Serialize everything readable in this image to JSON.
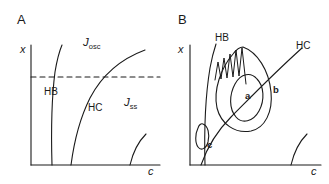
{
  "figure": {
    "background": "#ffffff",
    "stroke": "#1a1a1a",
    "width": 329,
    "height": 184
  },
  "panels": [
    {
      "id": "A",
      "letter": "A",
      "axes": {
        "y_label": "x",
        "x_label": "c"
      },
      "curves": [
        {
          "name": "HB",
          "label": "HB",
          "kind": "hopf-bifurcation-curve"
        },
        {
          "name": "HC",
          "label": "HC",
          "kind": "homoclinic-curve"
        },
        {
          "name": "saddle-node",
          "label": "",
          "kind": "lower-right-curve"
        },
        {
          "name": "dashed-section",
          "label": "",
          "kind": "dashed-horizontal-line"
        }
      ],
      "regions": [
        {
          "id": "J_osc",
          "base": "J",
          "sub": "osc"
        },
        {
          "id": "J_ss",
          "base": "J",
          "sub": "ss"
        }
      ]
    },
    {
      "id": "B",
      "letter": "B",
      "axes": {
        "y_label": "x",
        "x_label": "c"
      },
      "curves": [
        {
          "name": "HB",
          "label": "HB",
          "kind": "hopf-bifurcation-curve"
        },
        {
          "name": "HC",
          "label": "HC",
          "kind": "homoclinic-curve"
        },
        {
          "name": "saddle-node",
          "label": "",
          "kind": "lower-right-curve"
        },
        {
          "name": "oscillation",
          "label": "",
          "kind": "spiky-oscillation-trace"
        }
      ],
      "loops": [
        {
          "id": "a",
          "label": "a",
          "kind": "inner-limit-cycle"
        },
        {
          "id": "b",
          "label": "b",
          "kind": "outer-limit-cycle"
        },
        {
          "id": "c",
          "label": "c",
          "kind": "small-limit-cycle"
        }
      ]
    }
  ]
}
